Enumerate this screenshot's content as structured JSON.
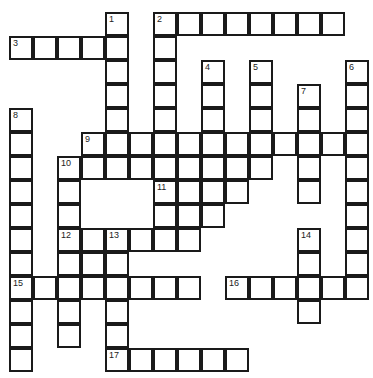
{
  "puzzle": {
    "type": "crossword",
    "origin": {
      "x": 10,
      "y": 13
    },
    "cell_size": 24,
    "colors": {
      "line": "#1a1a1a",
      "cell": "#ffffff",
      "number": "#222222"
    },
    "cells": [
      [
        4,
        0,
        "1"
      ],
      [
        6,
        0,
        "2"
      ],
      [
        7,
        0,
        ""
      ],
      [
        8,
        0,
        ""
      ],
      [
        9,
        0,
        ""
      ],
      [
        10,
        0,
        ""
      ],
      [
        11,
        0,
        ""
      ],
      [
        12,
        0,
        ""
      ],
      [
        13,
        0,
        ""
      ],
      [
        0,
        1,
        "3"
      ],
      [
        1,
        1,
        ""
      ],
      [
        2,
        1,
        ""
      ],
      [
        3,
        1,
        ""
      ],
      [
        4,
        1,
        ""
      ],
      [
        6,
        1,
        ""
      ],
      [
        4,
        2,
        ""
      ],
      [
        6,
        2,
        ""
      ],
      [
        8,
        2,
        "4"
      ],
      [
        10,
        2,
        "5"
      ],
      [
        14,
        2,
        "6"
      ],
      [
        4,
        3,
        ""
      ],
      [
        6,
        3,
        ""
      ],
      [
        8,
        3,
        ""
      ],
      [
        10,
        3,
        ""
      ],
      [
        12,
        3,
        "7"
      ],
      [
        14,
        3,
        ""
      ],
      [
        0,
        4,
        "8"
      ],
      [
        4,
        4,
        ""
      ],
      [
        6,
        4,
        ""
      ],
      [
        8,
        4,
        ""
      ],
      [
        10,
        4,
        ""
      ],
      [
        12,
        4,
        ""
      ],
      [
        14,
        4,
        ""
      ],
      [
        0,
        5,
        ""
      ],
      [
        3,
        5,
        "9"
      ],
      [
        4,
        5,
        ""
      ],
      [
        5,
        5,
        ""
      ],
      [
        6,
        5,
        ""
      ],
      [
        7,
        5,
        ""
      ],
      [
        8,
        5,
        ""
      ],
      [
        9,
        5,
        ""
      ],
      [
        10,
        5,
        ""
      ],
      [
        11,
        5,
        ""
      ],
      [
        12,
        5,
        ""
      ],
      [
        13,
        5,
        ""
      ],
      [
        14,
        5,
        ""
      ],
      [
        0,
        6,
        ""
      ],
      [
        2,
        6,
        "10"
      ],
      [
        3,
        6,
        ""
      ],
      [
        4,
        6,
        ""
      ],
      [
        5,
        6,
        ""
      ],
      [
        6,
        6,
        ""
      ],
      [
        7,
        6,
        ""
      ],
      [
        8,
        6,
        ""
      ],
      [
        9,
        6,
        ""
      ],
      [
        10,
        6,
        ""
      ],
      [
        12,
        6,
        ""
      ],
      [
        14,
        6,
        ""
      ],
      [
        0,
        7,
        ""
      ],
      [
        2,
        7,
        ""
      ],
      [
        6,
        7,
        "11"
      ],
      [
        7,
        7,
        ""
      ],
      [
        8,
        7,
        ""
      ],
      [
        9,
        7,
        ""
      ],
      [
        12,
        7,
        ""
      ],
      [
        14,
        7,
        ""
      ],
      [
        0,
        8,
        ""
      ],
      [
        2,
        8,
        ""
      ],
      [
        6,
        8,
        ""
      ],
      [
        7,
        8,
        ""
      ],
      [
        8,
        8,
        ""
      ],
      [
        14,
        8,
        ""
      ],
      [
        0,
        9,
        ""
      ],
      [
        2,
        9,
        "12"
      ],
      [
        3,
        9,
        ""
      ],
      [
        4,
        9,
        "13"
      ],
      [
        5,
        9,
        ""
      ],
      [
        6,
        9,
        ""
      ],
      [
        7,
        9,
        ""
      ],
      [
        12,
        9,
        "14"
      ],
      [
        14,
        9,
        ""
      ],
      [
        0,
        10,
        ""
      ],
      [
        2,
        10,
        ""
      ],
      [
        3,
        10,
        ""
      ],
      [
        4,
        10,
        ""
      ],
      [
        12,
        10,
        ""
      ],
      [
        14,
        10,
        ""
      ],
      [
        0,
        11,
        "15"
      ],
      [
        1,
        11,
        ""
      ],
      [
        2,
        11,
        ""
      ],
      [
        3,
        11,
        ""
      ],
      [
        4,
        11,
        ""
      ],
      [
        5,
        11,
        ""
      ],
      [
        6,
        11,
        ""
      ],
      [
        7,
        11,
        ""
      ],
      [
        9,
        11,
        "16"
      ],
      [
        10,
        11,
        ""
      ],
      [
        11,
        11,
        ""
      ],
      [
        12,
        11,
        ""
      ],
      [
        13,
        11,
        ""
      ],
      [
        14,
        11,
        ""
      ],
      [
        0,
        12,
        ""
      ],
      [
        2,
        12,
        ""
      ],
      [
        4,
        12,
        ""
      ],
      [
        12,
        12,
        ""
      ],
      [
        0,
        13,
        ""
      ],
      [
        2,
        13,
        ""
      ],
      [
        4,
        13,
        ""
      ],
      [
        0,
        14,
        ""
      ],
      [
        4,
        14,
        "17"
      ],
      [
        5,
        14,
        ""
      ],
      [
        6,
        14,
        ""
      ],
      [
        7,
        14,
        ""
      ],
      [
        8,
        14,
        ""
      ],
      [
        9,
        14,
        ""
      ]
    ],
    "clue_numbers": [
      "1",
      "2",
      "3",
      "4",
      "5",
      "6",
      "7",
      "8",
      "9",
      "10",
      "11",
      "12",
      "13",
      "14",
      "15",
      "16",
      "17"
    ]
  }
}
